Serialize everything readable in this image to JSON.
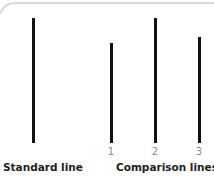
{
  "diagram": {
    "standard": {
      "label": "Standard line",
      "relative_length": 1.0
    },
    "comparison": {
      "label": "Comparison lines",
      "lines": [
        {
          "number": "1",
          "relative_length": 0.8
        },
        {
          "number": "2",
          "relative_length": 1.0
        },
        {
          "number": "3",
          "relative_length": 0.85
        }
      ]
    },
    "colors": {
      "line": "#111111",
      "number": "#8a8a8a",
      "label": "#222222",
      "frame": "#d8d8d8"
    }
  }
}
